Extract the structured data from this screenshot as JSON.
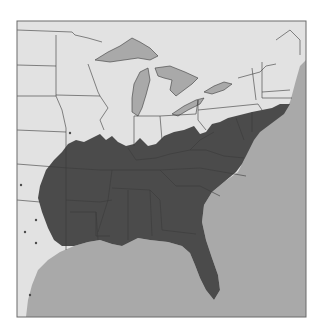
{
  "map": {
    "type": "species-range-map",
    "region": "Eastern United States",
    "colors": {
      "land": "#e2e2e2",
      "water": "#a9a9a9",
      "range": "#4b4b4b",
      "border": "#3a3a3a",
      "frame": "#6a6a6a",
      "background": "#ffffff"
    },
    "legend": "",
    "labels": []
  }
}
